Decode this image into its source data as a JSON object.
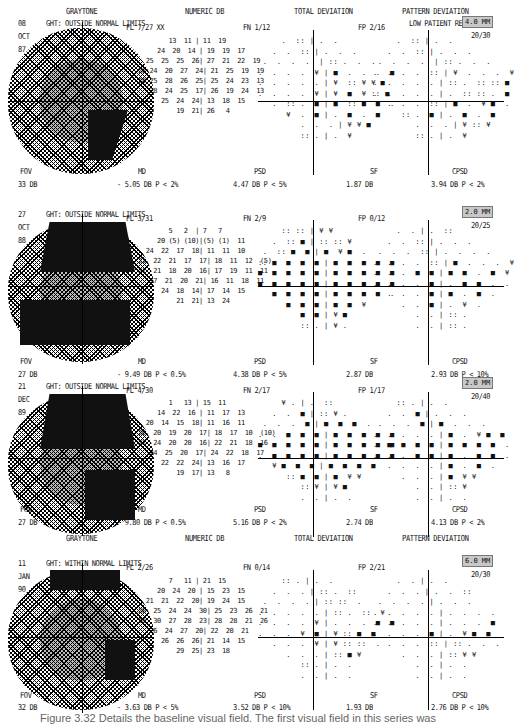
{
  "headers": {
    "graytone": "GRAYTONE",
    "numeric": "NUMERIC DB",
    "total": "TOTAL DEVIATION",
    "pattern": "PATTERN DEVIATION"
  },
  "tests": [
    {
      "day": "08",
      "month": "OCT",
      "year": "87",
      "ght": "GHT: OUTSIDE NORMAL LIMITS",
      "fl": "FL  7/27 XX",
      "fn": "FN  1/12",
      "fp": "FP  2/16",
      "reliability": "LOW PATIENT RELIABIL",
      "pupil": "4.0 MM",
      "acuity": "20/30",
      "fov_label": "FOV",
      "fov": "33 DB",
      "md_label": "MD",
      "md": "- 5.05 DB  P <  2%",
      "psd_label": "PSD",
      "psd": "4.47 DB  P <  5%",
      "sf_label": "SF",
      "sf": "1.87 DB",
      "cpsd_label": "CPSD",
      "cpsd": "3.94 DB  P <  2%",
      "numeric": "        13  11 | 11  19\n     24  20  14 | 19  19  17\n  25  25  25  26| 27  21  22  19\n28 24  20  27  24| 21  25  19  19\n28 25  28  26  25| 25  24  23  13\n   28  24  25  17| 26  19  24  13\n      25  24  24| 13  18  15\n          19  21| 26   4",
      "total_dev": "     .  :: | .  .\n   .  .  :: | .  .  .\n .  .  .  .  | :: .  .  .\n.  .  .  .  ¥ | ■  .  .  .  ■\n.  .  .  .  . | ¥  :: ¥ ¥ ■\n.  .  .  .  ¥ | ¥  ■  ¥ :: ■\n   .  :: .  ■ | ■  :: ■  ■  .\n      ¥  .  ■ | .  ■  .  ■\n         .  .  . | ¥ ¥ ■\n         :: . | .  ¥",
      "pattern_dev": "     .  :: | .  .\n   .  .  :: | .  .  .\n .  .  .  .  | :: .  .  .\n.  .  .  .  :: | ¥  .  .  .  ¥\n.  .  .  .  . | :: .  :: :: ■\n.  .  .  .  . | .  :: :: .  ■\n   .  .  .  :: | ■  .  ¥ ■  .\n      :: .  ■ | .  ■  .  ■\n         .  .  . | ¥ :: ¥\n         :: . | .  ¥"
    },
    {
      "day": "27",
      "month": "OCT",
      "year": "88",
      "ght": "GHT: OUTSIDE NORMAL LIMITS",
      "fl": "FL  3/31",
      "fn": "FN  2/9",
      "fp": "FP  0/12",
      "reliability": "",
      "pupil": "2.0 MM",
      "acuity": "20/25",
      "fov_label": "FOV",
      "fov": "27 DB",
      "md_label": "MD",
      "md": "- 9.49 DB  P < 0.5%",
      "psd_label": "PSD",
      "psd": "4.38 DB  P <  5%",
      "sf_label": "SF",
      "sf": "2.87 DB",
      "cpsd_label": "CPSD",
      "cpsd": "2.93 DB  P <  10%",
      "numeric": "        5   2  | 7   7\n     20 (5) (10)|(5) (1)  11\n  24  22  17  18| 11  11  10\n21  22  21  17  17| 18  11  12  (5)\n21  21  18  20  16| 17  19  11  11\n   17  21  20  21| 16  11  18  11\n      24  18  14| 17  14  15\n          21  21| 13  24",
      "total_dev": "     :: :: | ¥ ¥\n   .  :: ■ | :: :: ¥\n .  :: ■  ■ | ■  ¥ ■  .\n:: ■  ■  ■  ■ | ■  ■  ■  ■  ■\n■  ■  ■  ■  ■ | ■  ■  ■  ■  ■\n■  ■  ■  ■  ■ | ■  ■  ■  ■  ■\n   ■  ■  ■  ■ | ■  ■  ■  ■  .\n      ■  ■  ■ | ■  ■  ¥\n         ■  ■ | ¥ ■\n         :: . | ¥ .",
      "pattern_dev": "     .  . | .  ::\n   .  .  :: | .  .  .\n .  .  .  :: | .  .  .  .\n.  .  .  .  :: | ■  .  .  .  ¥\n.  .  .  ■  ■ | ■  ■  .  ■  ¥\n.  .  .  .  ■ | .  ■  ■  .  .\n   .  .  .  ■ | ■  .  ■  .\n      .  .  ■ | .  ¥  .\n         .  . | :: .\n         .  . | :: ."
    },
    {
      "day": "21",
      "month": "DEC",
      "year": "89",
      "ght": "GHT: OUTSIDE NORMAL LIMITS",
      "fl": "FL  4/30",
      "fn": "FN  2/17",
      "fp": "FP  1/17",
      "reliability": "",
      "pupil": "2.0 MM",
      "acuity": "20/40",
      "fov_label": "FOV",
      "fov": "27 DB",
      "md_label": "MD",
      "md": "- 9.80 DB  P < 0.5%",
      "psd_label": "PSD",
      "psd": "5.16 DB  P <  2%",
      "sf_label": "SF",
      "sf": "2.74 DB",
      "cpsd_label": "CPSD",
      "cpsd": "4.13 DB  P <  2%",
      "numeric": "        1   13 | 15  11\n     14  22  16 | 11  17  13\n  20  14  15  18| 11  16  11\n20  20  19  20  17| 18  17  10  (10)\n23  24  20  20  16| 22  21  18  16\n   24  25  20  17| 24  22  18  17\n      22  22  24| 13  16  17\n          19  17| 13   8",
      "total_dev": "     ¥ . | .  ::\n   .  .  ■ | :: ¥ .\n .  .  .  ■ | ■  ■  ■  .\n.  .  ■  ■  ■ | ■  ■  ■  ■  ■\n■  ■  ■  ■  ■ | ■  ■  ■  ■  ■\n.  ■  ■  ■  ■ | ■  ■  ■  ■  ■\n   ¥ ■  ■  ■ | ■  ■  ■  ■\n      :: ■  ■ | ■  ¥ ¥\n         :: ¥ | ¥ ■\n         .  . | .  .",
      "pattern_dev": "     :: . | .  .\n   .  .  ■ | .  .  .\n .  .  .  ■ | ■  .  .  .\n.  .  .  .  . | ■  .  ¥ ■  ■\n.  ■  ■  ■  ■ | ■  ■  ■  ■  .\n.  .  .  ■  ■ | ■  .  ■  ■  .\n   .  .  .  . | ■  .  ■  .\n      .  .  . | ■  ¥ ¥\n         .  . | :: ¥\n         .  . | .  ."
    },
    {
      "day": "11",
      "month": "JAN",
      "year": "90",
      "ght": "GHT: WITHIN NORMAL LIMITS",
      "fl": "FL  2/26",
      "fn": "FN  0/14",
      "fp": "FP  2/21",
      "reliability": "",
      "pupil": "6.0 MM",
      "acuity": "20/30",
      "fov_label": "FOV",
      "fov": "32 DB",
      "md_label": "MD",
      "md": "- 3.63 DB  P <  5%",
      "psd_label": "PSD",
      "psd": "3.52 DB  P <  10%",
      "sf_label": "SF",
      "sf": "1.93 DB",
      "cpsd_label": "CPSD",
      "cpsd": "2.76 DB  P <  10%",
      "numeric": "        7   11 | 21  15\n     20  24  20 | 15  23  15\n  21  21  22  20| 19  24  15\n26  25  24  24  30| 25  23  26  21\n28  30  27  28  23| 28  28  21  26\n   26  24  27  20| 22  20  21\n      26  26  26| 21  14  15\n          29  25| 23  18",
      "total_dev": "     :: . | .  .\n   .  .  . | :: .  ::\n .  .  .  . | :: ::  .\n.  .  .  .  . | :: .  ::  ¥\n.  .  .  .  ¥ | .  .  .  ■  ■\n.  .  .  ¥  ■ | ¥ :: ■  ■\n   .  .  .  ¥ | ¥ :: ::  .\n      .  .  . | :: ■ ¥\n         :: . | .  .\n         .  . | .  .",
      "pattern_dev": "     .  . | .  .\n   .  .  . | .  .  ::\n .  .  .  . | .  .  .\n.  .  .  .  . | .  .  .  .\n.  .  .  .  . | .  .  .  ■\n.  .  .  .  ■ | .  ¥ ■  ■\n   .  .  .  :: | :: .  .  .\n      .  .  . | :: ¥ ¥\n         .  . | .  .\n         .  . | .  ."
    }
  ],
  "caption": "Figure 3.32  Details the baseline visual field. The first visual field in this series was"
}
